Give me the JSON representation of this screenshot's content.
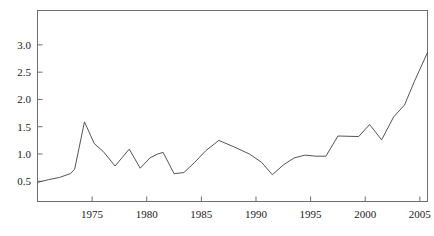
{
  "chart_data": {
    "type": "line",
    "title": "",
    "subtitle": "",
    "xlabel": "",
    "ylabel": "",
    "xlim": [
      1970.0,
      2005.7
    ],
    "ylim": [
      0.13,
      3.63
    ],
    "grid": false,
    "legend": null,
    "xticks": [
      1975,
      1980,
      1985,
      1990,
      1995,
      2000,
      2005
    ],
    "xtick_labels": [
      "1975",
      "1980",
      "1985",
      "1990",
      "1995",
      "2000",
      "2005"
    ],
    "yticks": [
      0.5,
      1.0,
      1.5,
      2.0,
      2.5,
      3.0
    ],
    "ytick_labels": [
      "0.5",
      "1.0",
      "1.5",
      "2.0",
      "2.5",
      "3.0"
    ],
    "series": [
      {
        "name": "series-1",
        "color": "#555555",
        "x": [
          1970.0,
          1971.0,
          1972.0,
          1973.0,
          1973.4,
          1974.3,
          1975.2,
          1976.0,
          1977.1,
          1978.4,
          1979.4,
          1980.3,
          1981.0,
          1981.5,
          1982.5,
          1983.4,
          1984.4,
          1985.4,
          1986.6,
          1988.0,
          1989.4,
          1990.5,
          1991.5,
          1992.5,
          1993.5,
          1994.5,
          1995.5,
          1996.4,
          1997.5,
          1999.4,
          2000.4,
          2001.5,
          2002.6,
          2003.6,
          2004.5,
          2005.7
        ],
        "y": [
          0.48,
          0.53,
          0.57,
          0.64,
          0.72,
          1.59,
          1.19,
          1.05,
          0.78,
          1.09,
          0.74,
          0.93,
          1.0,
          1.03,
          0.64,
          0.66,
          0.85,
          1.06,
          1.25,
          1.13,
          1.0,
          0.85,
          0.62,
          0.8,
          0.93,
          0.98,
          0.96,
          0.96,
          1.33,
          1.32,
          1.54,
          1.26,
          1.68,
          1.9,
          2.33,
          2.86
        ]
      }
    ]
  },
  "axes": {
    "frame_color": "#6e6e6e",
    "tick_color": "#6e6e6e",
    "line_color": "#555555"
  }
}
